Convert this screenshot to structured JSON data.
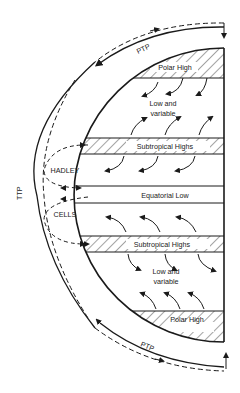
{
  "diagram": {
    "labels": {
      "ptp_north": "PTP",
      "ptp_south": "PTP",
      "ttp": "TTP",
      "hadley": "HADLEY",
      "cells": "CELLS"
    },
    "bands": [
      {
        "id": "polar-high-north",
        "label": "Polar High",
        "hatched": true
      },
      {
        "id": "low-variable-north",
        "label_line1": "Low and",
        "label_line2": "variable",
        "hatched": false
      },
      {
        "id": "subtropical-highs-north",
        "label": "Subtropical Highs",
        "hatched": true
      },
      {
        "id": "equatorial-low",
        "label": "Equatorial Low",
        "hatched": false
      },
      {
        "id": "subtropical-highs-south",
        "label": "Subtropical Highs",
        "hatched": true
      },
      {
        "id": "low-variable-south",
        "label_line1": "Low and",
        "label_line2": "variable",
        "hatched": false
      },
      {
        "id": "polar-high-south",
        "label": "Polar High",
        "hatched": true
      }
    ],
    "colors": {
      "ink": "#1a1a1a",
      "background": "#ffffff"
    }
  }
}
